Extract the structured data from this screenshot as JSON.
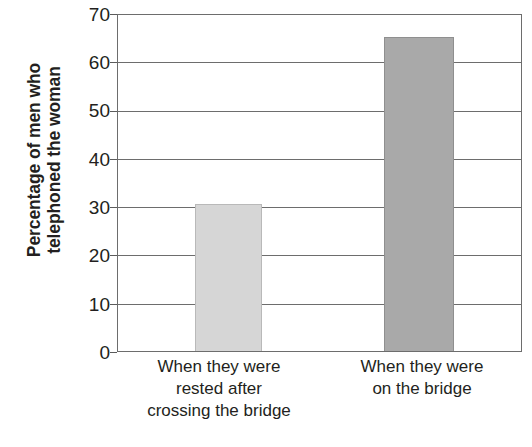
{
  "chart_data": {
    "type": "bar",
    "title": "",
    "subtitle": "",
    "xlabel": "",
    "ylabel": "Percentage of men who telephoned the woman",
    "ylabel_lines": [
      "Percentage of men who",
      "telephoned the woman"
    ],
    "categories": [
      "When they were rested after crossing the bridge",
      "When they were on the bridge"
    ],
    "category_lines": [
      [
        "When they were",
        "rested after",
        "crossing the bridge"
      ],
      [
        "When they were",
        "on the bridge"
      ]
    ],
    "values": [
      30.5,
      65
    ],
    "ylim": [
      0,
      70
    ],
    "yticks": [
      70,
      60,
      50,
      40,
      30,
      20,
      10,
      0
    ],
    "ytick_labels": [
      "70",
      "60",
      "50",
      "40",
      "30",
      "20",
      "10",
      "0"
    ],
    "grid": true,
    "grid_axis": "y",
    "legend": false,
    "legend_position": "none",
    "bar_colors": [
      "#d6d6d6",
      "#a9a9a9"
    ],
    "bar_border_colors": [
      "#b9b9b9",
      "#8f8f8f"
    ],
    "axis_color": "#6d6d6d",
    "text_color": "#231f20",
    "background": "#ffffff"
  }
}
